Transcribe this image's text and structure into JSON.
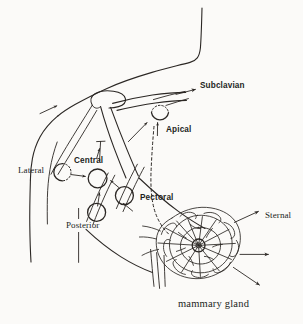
{
  "figure": {
    "background_color": "#fbfaf8",
    "ink_color": "#2b2724",
    "width": 303,
    "height": 324
  },
  "labels": {
    "subclavian": "Subclavian",
    "apical": "Apical",
    "lateral": "Lateral",
    "central": "Central",
    "pectoral": "Pectoral",
    "posterior": "Posterior",
    "sternal": "Sternal",
    "mammary_gland": "mammary gland"
  },
  "nodes": [
    {
      "name": "apical",
      "label": "Apical",
      "cx": 160,
      "cy": 113,
      "r": 8.5,
      "style": "half-dotted-top"
    },
    {
      "name": "lateral",
      "label": "Lateral",
      "cx": 62,
      "cy": 172,
      "r": 8.5,
      "style": "half-dotted-right"
    },
    {
      "name": "central",
      "label": "Central",
      "cx": 97,
      "cy": 178,
      "r": 9.5,
      "style": "solid"
    },
    {
      "name": "pectoral",
      "label": "Pectoral",
      "cx": 124,
      "cy": 196,
      "r": 9.0,
      "style": "solid-crossed"
    },
    {
      "name": "posterior",
      "label": "Posterior",
      "cx": 97,
      "cy": 212,
      "r": 9.0,
      "style": "solid-crossed"
    }
  ],
  "annotation_arrows": [
    {
      "name": "subclavian-arrow",
      "label": "Subclavian",
      "direction": "right"
    },
    {
      "name": "apical-arrow",
      "label": "Apical",
      "direction": "up"
    },
    {
      "name": "lateral-to-central-arrow",
      "label": "Central",
      "direction": "right"
    },
    {
      "name": "sternal-arrow",
      "label": "Sternal",
      "direction": "up-right"
    },
    {
      "name": "gland-lateral-arrow",
      "label": "",
      "direction": "right"
    },
    {
      "name": "gland-inferior-arrow",
      "label": "",
      "direction": "down-right"
    }
  ],
  "anatomy": [
    {
      "name": "neck-and-shoulder-contour"
    },
    {
      "name": "arm-outline"
    },
    {
      "name": "humerus-head"
    },
    {
      "name": "clavicle"
    },
    {
      "name": "chest-wall"
    },
    {
      "name": "mammary-gland-lobules"
    },
    {
      "name": "nipple"
    },
    {
      "name": "deep-lymphatic-pathway"
    }
  ]
}
